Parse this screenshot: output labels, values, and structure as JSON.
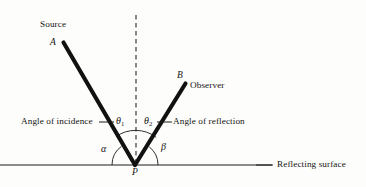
{
  "figure": {
    "background_color": "#fdfdfb",
    "ink_color": "#141414",
    "width": 366,
    "height": 187
  },
  "labels": {
    "source": "Source",
    "point_a": "A",
    "point_b": "B",
    "observer": "Observer",
    "point_p": "P",
    "angle_of_incidence": "Angle of incidence",
    "angle_of_reflection": "Angle of reflection",
    "reflecting_surface": "Reflecting surface",
    "theta_one": "θ",
    "theta_one_sub": "1",
    "theta_two": "θ",
    "theta_two_sub": "2",
    "alpha": "α",
    "beta": "β"
  },
  "geometry": {
    "vertex_p": {
      "x": 135,
      "y": 165
    },
    "point_a": {
      "x": 63,
      "y": 42
    },
    "point_b": {
      "x": 186,
      "y": 83
    },
    "normal_line": {
      "x": 136,
      "y_top": 15,
      "y_bottom": 165,
      "style": "dashed"
    },
    "surface_line": {
      "x_start": 0,
      "x_end": 272,
      "y": 165
    },
    "theta_arc_radius": 34,
    "alpha_beta_arc_radius": 23,
    "incident_angle_from_normal_deg": 30,
    "reflected_angle_from_normal_deg": 32
  }
}
